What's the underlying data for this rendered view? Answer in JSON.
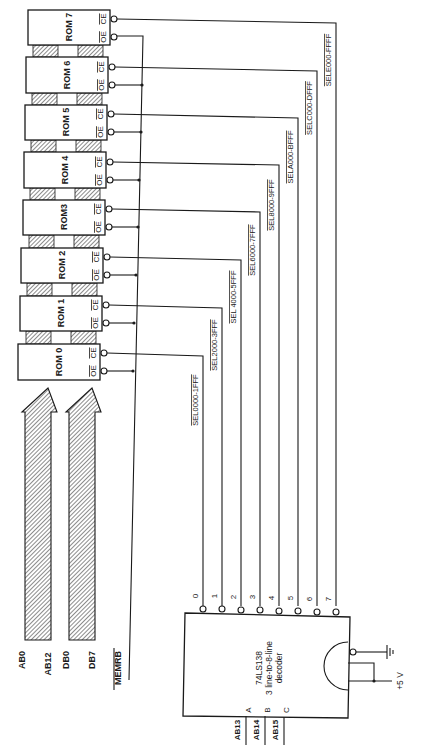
{
  "figure": {
    "type": "schematic",
    "orientation": "rotated-90-ccw",
    "colors": {
      "ink": "#1a1a1a",
      "paper": "#ffffff"
    }
  },
  "roms": [
    {
      "label": "ROM 0",
      "oe": "OE",
      "ce": "CE"
    },
    {
      "label": "ROM 1",
      "oe": "OE",
      "ce": "CE"
    },
    {
      "label": "ROM 2",
      "oe": "OE",
      "ce": "CE"
    },
    {
      "label": "ROM3",
      "oe": "OE",
      "ce": "CE"
    },
    {
      "label": "ROM 4",
      "oe": "OE",
      "ce": "CE"
    },
    {
      "label": "ROM 5",
      "oe": "OE",
      "ce": "CE"
    },
    {
      "label": "ROM 6",
      "oe": "OE",
      "ce": "CE"
    },
    {
      "label": "ROM 7",
      "oe": "OE",
      "ce": "CE"
    }
  ],
  "buses": {
    "address": {
      "start": "AB0",
      "end": "AB12"
    },
    "data": {
      "start": "DB0",
      "end": "DB7"
    },
    "memrb": "MEMRB"
  },
  "decoder": {
    "part": "74LS138",
    "desc1": "3 line-to-8-line",
    "desc2": "decoder",
    "inputs": [
      {
        "pin": "A",
        "signal": "AB13"
      },
      {
        "pin": "B",
        "signal": "AB14"
      },
      {
        "pin": "C",
        "signal": "AB15"
      }
    ],
    "outputs": [
      "0",
      "1",
      "2",
      "3",
      "4",
      "5",
      "6",
      "7"
    ],
    "power": "+5 V"
  },
  "select_lines": [
    "SEL0000-1FFF",
    "SEL2000-3FFF",
    "SEL 4000-5FFF",
    "SEL6000-7FFF",
    "SEL8000-9FFF",
    "SELA000-BFFF",
    "SELC000-DFFF",
    "SELE000-FFFF"
  ]
}
